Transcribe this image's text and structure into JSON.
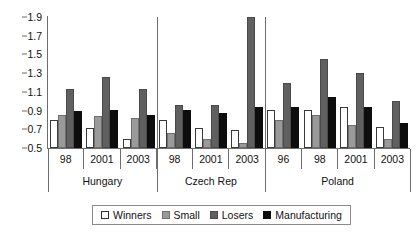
{
  "chart_data": {
    "type": "bar",
    "title": "",
    "xlabel": "",
    "ylabel": "",
    "ylim": [
      0.5,
      1.9
    ],
    "ytick_step": 0.2,
    "yticks": [
      "0.5",
      "0.7",
      "0.9",
      "1.1",
      "1.3",
      "1.5",
      "1.7",
      "1.9"
    ],
    "ytick_values": [
      0.5,
      0.7,
      0.9,
      1.1,
      1.3,
      1.5,
      1.7,
      1.9
    ],
    "grid": false,
    "legend_position": "bottom",
    "series": [
      {
        "name": "Winners",
        "color": "#ffffff",
        "values": [
          0.8,
          0.71,
          0.6,
          0.8,
          0.71,
          0.69,
          0.91,
          0.91,
          0.94,
          0.72
        ]
      },
      {
        "name": "Small",
        "color": "#9a9a9a",
        "values": [
          0.85,
          0.84,
          0.82,
          0.66,
          0.6,
          0.55,
          0.8,
          0.85,
          0.75,
          0.6
        ]
      },
      {
        "name": "Losers",
        "color": "#606060",
        "values": [
          1.13,
          1.26,
          1.13,
          0.96,
          0.96,
          1.9,
          1.2,
          1.45,
          1.3,
          1.0
        ]
      },
      {
        "name": "Manufacturing",
        "color": "#0d0d0d",
        "values": [
          0.9,
          0.91,
          0.85,
          0.91,
          0.87,
          0.94,
          0.94,
          1.05,
          0.94,
          0.77
        ]
      }
    ],
    "categories": [
      "98",
      "2001",
      "2003",
      "98",
      "2001",
      "2003",
      "96",
      "98",
      "2001",
      "2003"
    ],
    "groups": [
      {
        "label": "Hungary",
        "years": [
          "98",
          "2001",
          "2003"
        ]
      },
      {
        "label": "Czech Rep",
        "years": [
          "98",
          "2001",
          "2003"
        ]
      },
      {
        "label": "Poland",
        "years": [
          "96",
          "98",
          "2001",
          "2003"
        ]
      }
    ]
  },
  "legend": {
    "items": [
      {
        "label": "Winners",
        "key": "winners"
      },
      {
        "label": "Small",
        "key": "small"
      },
      {
        "label": "Losers",
        "key": "losers"
      },
      {
        "label": "Manufacturing",
        "key": "manufacturing"
      }
    ]
  }
}
